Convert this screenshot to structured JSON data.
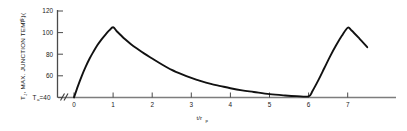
{
  "chart_data": {
    "type": "line",
    "title": "",
    "subtitle": "",
    "xlabel": "t/r",
    "xlabel_sub": "p",
    "ylabel_main": "T",
    "ylabel_main_sub": "J",
    "ylabel_rest": ", MAX. JUNCTION TEMP. (",
    "ylabel_unit": "°C",
    "ylabel_close": ")",
    "baseline_label_main": "T",
    "baseline_label_sub": "a",
    "baseline_label_eq": "=40",
    "axis_break_symbol": "//",
    "grid": false,
    "legend": "none",
    "xlim": [
      -0.35,
      7.55
    ],
    "ylim": [
      40,
      120
    ],
    "xticks": [
      0,
      1,
      2,
      3,
      4,
      5,
      6,
      7
    ],
    "xtick_labels": [
      "0",
      "1",
      "2",
      "3",
      "4",
      "5",
      "6",
      "7"
    ],
    "yticks": [
      40,
      60,
      80,
      100,
      120
    ],
    "ytick_labels": [
      "40",
      "60",
      "80",
      "100",
      "120"
    ],
    "ytick_labels_visible": [
      "120",
      "100",
      "80",
      "60"
    ],
    "series": [
      {
        "name": "max junction temperature",
        "x": [
          0.0,
          0.1,
          0.2,
          0.3,
          0.4,
          0.5,
          0.6,
          0.7,
          0.8,
          0.9,
          1.0,
          1.1,
          1.2,
          1.3,
          1.45,
          1.6,
          1.8,
          2.0,
          2.25,
          2.5,
          2.75,
          3.0,
          3.25,
          3.5,
          3.75,
          4.0,
          4.3,
          4.6,
          5.0,
          5.4,
          5.7,
          6.0,
          6.1,
          6.25,
          6.4,
          6.55,
          6.7,
          6.85,
          7.0,
          7.1,
          7.3,
          7.5
        ],
        "y": [
          40.0,
          50.5,
          60.0,
          68.5,
          76.0,
          82.5,
          88.5,
          93.5,
          98.0,
          102.0,
          105.0,
          101.0,
          97.5,
          94.0,
          89.5,
          85.5,
          80.5,
          76.0,
          70.5,
          65.5,
          61.5,
          58.0,
          55.0,
          52.5,
          50.5,
          48.5,
          46.5,
          45.0,
          43.0,
          41.8,
          41.2,
          41.0,
          46.0,
          56.0,
          67.0,
          78.0,
          88.0,
          97.0,
          104.5,
          102.0,
          94.5,
          86.5
        ]
      }
    ],
    "annotations": [
      {
        "text": "axis break on x-axis before 0",
        "symbol": "//"
      },
      {
        "text": "peak 1",
        "x": 1,
        "y": 105
      },
      {
        "text": "peak 2",
        "x": 7,
        "y": 105
      }
    ]
  },
  "figure": {
    "background_color": "#ffffff",
    "curve_color": "#111111",
    "axis_color": "#7d7d7d",
    "tick_color": "#4a4a4a",
    "text_color": "#1a1a1a"
  }
}
